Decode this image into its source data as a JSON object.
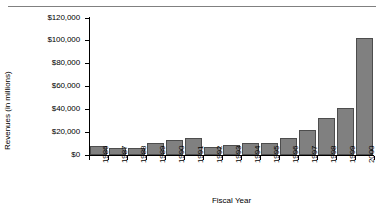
{
  "chart_data": {
    "type": "bar",
    "title": "",
    "xlabel": "Fiscal Year",
    "ylabel": "Revenues (in millions)",
    "categories": [
      "1986",
      "1987",
      "1988",
      "1989",
      "1990",
      "1991",
      "1992",
      "1993",
      "1994",
      "1995",
      "1996",
      "1997",
      "1998",
      "1999",
      "2000"
    ],
    "values": [
      7500,
      6000,
      6000,
      10500,
      13500,
      14500,
      7300,
      8800,
      10200,
      10200,
      14800,
      21500,
      32500,
      41000,
      102000
    ],
    "ylim": [
      0,
      120000
    ],
    "yticks": [
      0,
      20000,
      40000,
      60000,
      80000,
      100000,
      120000
    ],
    "ytick_labels": [
      "$0",
      "$20,000",
      "$40,000",
      "$60,000",
      "$80,000",
      "$100,000",
      "$120,000"
    ],
    "grid": false,
    "legend": false,
    "bar_color": "#808080",
    "bar_edge_color": "#4d4d4d",
    "axis_color": "#000000"
  },
  "decor": {
    "top_rule_color": "#808080"
  }
}
